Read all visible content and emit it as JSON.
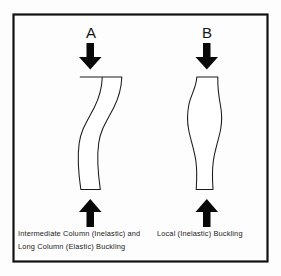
{
  "figure": {
    "frame": {
      "border_color": "#111111",
      "background_color": "#fdfdfd"
    },
    "panels": [
      {
        "id": "panel-a",
        "label": "A",
        "column_name": "s-curve-buckled-column",
        "buckling_mode": "global-flexural",
        "top_arrow": "down-arrow",
        "bottom_arrow": "up-arrow",
        "caption_line1": "Intermediate Column (Inelastic) and",
        "caption_line2": "Long Column (Elastic) Buckling"
      },
      {
        "id": "panel-b",
        "label": "B",
        "column_name": "bulged-buckled-column",
        "buckling_mode": "local",
        "top_arrow": "down-arrow",
        "bottom_arrow": "up-arrow",
        "caption_line1": "Local (Inelastic) Buckling",
        "caption_line2": ""
      }
    ],
    "colors": {
      "outline": "#1a1a1a",
      "arrow_fill": "#080808",
      "column_fill": "#ffffff",
      "text": "#1a1a1a"
    }
  }
}
